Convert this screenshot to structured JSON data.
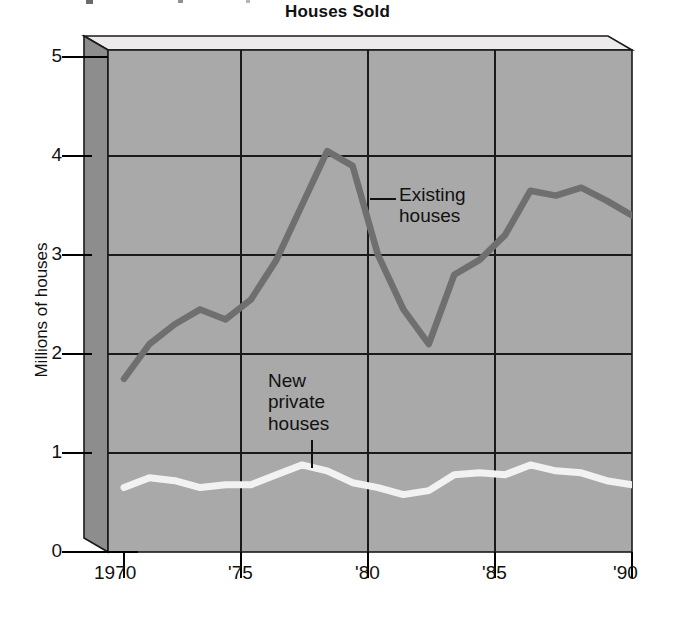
{
  "chart_data": {
    "type": "line",
    "title": "Houses Sold",
    "xlabel": "",
    "ylabel": "Millions of houses",
    "x": [
      1970,
      1971,
      1972,
      1973,
      1974,
      1975,
      1976,
      1977,
      1978,
      1979,
      1980,
      1981,
      1982,
      1983,
      1984,
      1985,
      1986,
      1987,
      1988,
      1989,
      1990
    ],
    "xtick_labels": [
      "1970",
      "'75",
      "'80",
      "'85",
      "'90"
    ],
    "xtick_values": [
      1970,
      1975,
      1980,
      1985,
      1990
    ],
    "ytick_labels": [
      "0",
      "1",
      "2",
      "3",
      "4",
      "5"
    ],
    "ytick_values": [
      0,
      1,
      2,
      3,
      4,
      5
    ],
    "xlim": [
      1970,
      1990
    ],
    "ylim": [
      0,
      5
    ],
    "grid": true,
    "legend": "annotations-in-plot",
    "series": [
      {
        "name": "Existing houses",
        "color": "#6f6f6f",
        "values": [
          1.75,
          2.1,
          2.3,
          2.45,
          2.35,
          2.55,
          2.95,
          3.5,
          4.05,
          3.9,
          3.0,
          2.45,
          2.1,
          2.8,
          2.95,
          3.2,
          3.65,
          3.6,
          3.68,
          3.55,
          3.4
        ]
      },
      {
        "name": "New private houses",
        "color": "#f2f2f2",
        "values": [
          0.65,
          0.75,
          0.72,
          0.65,
          0.68,
          0.68,
          0.78,
          0.88,
          0.82,
          0.7,
          0.65,
          0.58,
          0.62,
          0.78,
          0.8,
          0.78,
          0.88,
          0.82,
          0.8,
          0.72,
          0.68
        ]
      }
    ],
    "annotations": [
      {
        "text_lines": [
          "Existing",
          "houses"
        ],
        "series": "Existing houses",
        "leader": "horizontal-left"
      },
      {
        "text_lines": [
          "New",
          "private",
          "houses"
        ],
        "series": "New private houses",
        "leader": "vertical-down"
      }
    ],
    "colors": {
      "plot_background": "#a8a8a8",
      "box_top_face": "#eaeaea",
      "box_left_face": "#8d8d8d",
      "gridline": "#1a1a1a",
      "axis": "#000000",
      "text": "#111111"
    }
  },
  "title": "Houses Sold",
  "axes": {
    "y_axis_label": "Millions of houses",
    "y_ticks": [
      "5",
      "4",
      "3",
      "2",
      "1",
      "0"
    ],
    "x_ticks": [
      "1970",
      "'75",
      "'80",
      "'85",
      "'90"
    ]
  },
  "annotations": {
    "existing_line1": "Existing",
    "existing_line2": "houses",
    "new_line1": "New",
    "new_line2": "private",
    "new_line3": "houses"
  }
}
